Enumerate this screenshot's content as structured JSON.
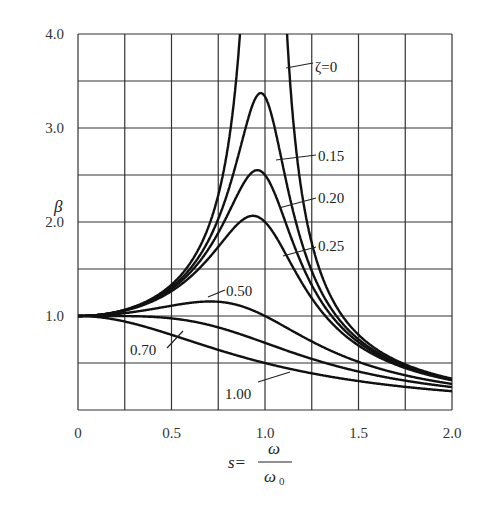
{
  "chart_data": {
    "type": "line",
    "title": "",
    "xlabel": "s = ω / ω0",
    "xlabel_parts": {
      "lhs": "s=",
      "num": "ω",
      "den": "ω",
      "den_sub": "0"
    },
    "ylabel": "β",
    "xlim": [
      0,
      2.0
    ],
    "ylim": [
      0,
      4.0
    ],
    "grid": true,
    "x_grid_step": 0.25,
    "y_grid_step": 0.5,
    "x_ticks": [
      {
        "value": 0,
        "label": "0"
      },
      {
        "value": 0.5,
        "label": "0.5"
      },
      {
        "value": 1.0,
        "label": "1.0"
      },
      {
        "value": 1.5,
        "label": "1.5"
      },
      {
        "value": 2.0,
        "label": "2.0"
      }
    ],
    "y_ticks": [
      {
        "value": 1.0,
        "label": "1.0"
      },
      {
        "value": 2.0,
        "label": "2.0"
      },
      {
        "value": 3.0,
        "label": "3.0"
      },
      {
        "value": 4.0,
        "label": "4.0"
      }
    ],
    "formula": "β = 1 / sqrt((1 - s^2)^2 + (2ζs)^2)",
    "x": [
      0,
      0.25,
      0.5,
      0.75,
      1.0,
      1.25,
      1.5,
      1.75,
      2.0
    ],
    "series": [
      {
        "name": "ζ=0",
        "zeta": 0.0,
        "values": [
          1.0,
          1.067,
          1.333,
          2.286,
          null,
          1.778,
          0.8,
          0.485,
          0.333
        ]
      },
      {
        "name": "0.15",
        "zeta": 0.15,
        "values": [
          1.0,
          1.064,
          1.307,
          2.033,
          3.333,
          1.479,
          0.753,
          0.479,
          0.327
        ]
      },
      {
        "name": "0.20",
        "zeta": 0.2,
        "values": [
          1.0,
          1.062,
          1.289,
          1.884,
          2.5,
          1.329,
          0.721,
          0.471,
          0.322
        ]
      },
      {
        "name": "0.25",
        "zeta": 0.25,
        "values": [
          1.0,
          1.059,
          1.265,
          1.736,
          2.0,
          1.189,
          0.686,
          0.462,
          0.316
        ]
      },
      {
        "name": "0.50",
        "zeta": 0.5,
        "values": [
          1.0,
          1.038,
          1.109,
          1.152,
          1.0,
          0.729,
          0.512,
          0.395,
          0.277
        ]
      },
      {
        "name": "0.70",
        "zeta": 0.7,
        "values": [
          1.0,
          0.999,
          0.975,
          0.879,
          0.714,
          0.544,
          0.409,
          0.32,
          0.244
        ]
      },
      {
        "name": "1.00",
        "zeta": 1.0,
        "values": [
          1.0,
          0.941,
          0.8,
          0.64,
          0.5,
          0.39,
          0.308,
          0.246,
          0.2
        ]
      }
    ],
    "annotations": [
      {
        "text": "ζ=0",
        "x": 315,
        "y": 72,
        "lead": [
          286,
          68,
          313,
          63
        ]
      },
      {
        "text": "0.15",
        "x": 318,
        "y": 161,
        "lead": [
          276,
          160,
          316,
          155
        ]
      },
      {
        "text": "0.20",
        "x": 318,
        "y": 203,
        "lead": [
          279,
          208,
          316,
          198
        ]
      },
      {
        "text": "0.25",
        "x": 318,
        "y": 251,
        "lead": [
          283,
          256,
          316,
          247
        ]
      },
      {
        "text": "0.50",
        "x": 226,
        "y": 296,
        "lead": [
          208,
          297,
          225,
          290
        ]
      },
      {
        "text": "0.70",
        "x": 130,
        "y": 355,
        "lead": [
          167,
          348,
          183,
          331
        ]
      },
      {
        "text": "1.00",
        "x": 225,
        "y": 399,
        "lead": [
          258,
          382,
          290,
          372
        ]
      }
    ],
    "legend": "inline labels"
  },
  "colors": {
    "line": "#111111",
    "grid": "#333333",
    "text": "#222222"
  }
}
